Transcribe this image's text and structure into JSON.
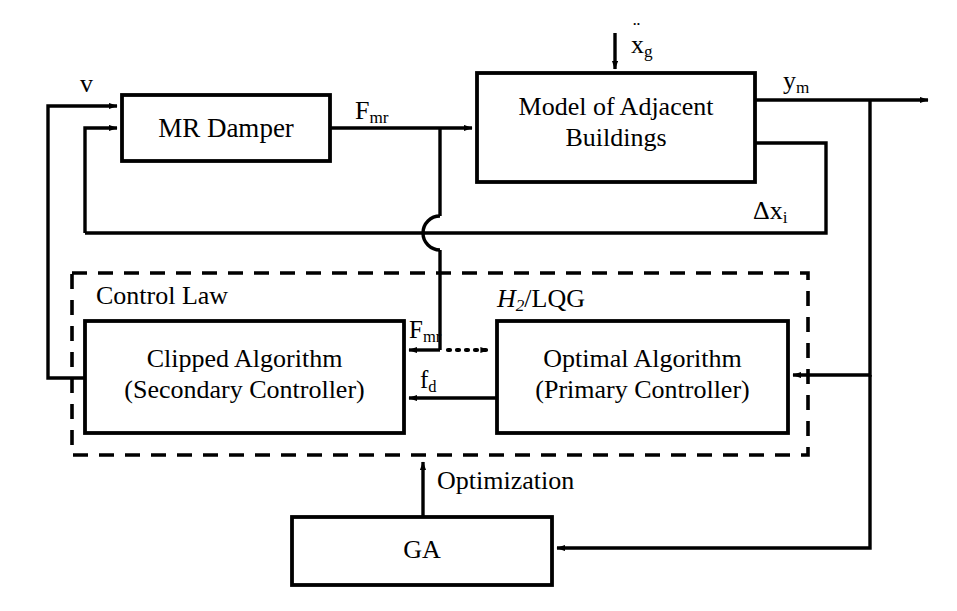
{
  "diagram": {
    "stroke_color": "#000000",
    "background_color": "#ffffff",
    "blocks": [
      {
        "id": "mr_damper",
        "label": "MR Damper"
      },
      {
        "id": "buildings",
        "label": "Model of Adjacent\nBuildings"
      },
      {
        "id": "clipped",
        "label": "Clipped Algorithm\n(Secondary Controller)"
      },
      {
        "id": "optimal",
        "label": "Optimal Algorithm\n(Primary Controller)"
      },
      {
        "id": "ga",
        "label": "GA"
      }
    ],
    "groups": [
      {
        "id": "control_law",
        "label": "Control Law",
        "style": "dashed"
      }
    ],
    "signals": [
      {
        "id": "v",
        "label": "v"
      },
      {
        "id": "f_mr_top",
        "label": "F",
        "sub": "mr"
      },
      {
        "id": "f_mr_mid",
        "label": "F",
        "sub": "mr"
      },
      {
        "id": "xg",
        "label": "x",
        "sub": "g",
        "accent": "double-dot"
      },
      {
        "id": "ym",
        "label": "y",
        "sub": "m"
      },
      {
        "id": "dx",
        "label": "Δx",
        "sub": "i"
      },
      {
        "id": "fd",
        "label": "f",
        "sub": "d"
      },
      {
        "id": "h2lqg",
        "label": "H",
        "sub": "2",
        "suffix": "/LQG",
        "italic_lead": true
      },
      {
        "id": "optimization",
        "label": "Optimization"
      }
    ]
  }
}
